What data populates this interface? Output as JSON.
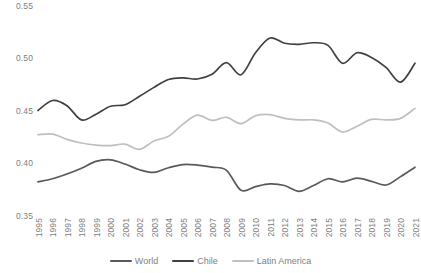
{
  "chart_data": {
    "type": "line",
    "title": "",
    "xlabel": "",
    "ylabel": "",
    "ylim": [
      0.35,
      0.55
    ],
    "yticks": [
      "0.35",
      "0.40",
      "0.45",
      "0.50",
      "0.55"
    ],
    "grid": false,
    "legend_position": "bottom",
    "categories": [
      "1995",
      "1996",
      "1997",
      "1998",
      "1999",
      "2000",
      "2001",
      "2002",
      "2003",
      "2004",
      "2005",
      "2006",
      "2007",
      "2008",
      "2009",
      "2010",
      "2011",
      "2012",
      "2013",
      "2014",
      "2015",
      "2016",
      "2017",
      "2018",
      "2019",
      "2020",
      "2021"
    ],
    "series": [
      {
        "name": "World",
        "color": "#595959",
        "values": [
          0.3825,
          0.3855,
          0.39,
          0.3955,
          0.402,
          0.4035,
          0.3995,
          0.394,
          0.3915,
          0.396,
          0.399,
          0.3985,
          0.3965,
          0.3935,
          0.3745,
          0.378,
          0.3805,
          0.379,
          0.3735,
          0.379,
          0.3855,
          0.3825,
          0.386,
          0.383,
          0.3795,
          0.3875,
          0.3965
        ]
      },
      {
        "name": "Chile",
        "color": "#404040",
        "values": [
          0.4505,
          0.46,
          0.455,
          0.4415,
          0.447,
          0.4545,
          0.456,
          0.464,
          0.4725,
          0.48,
          0.4815,
          0.4805,
          0.485,
          0.496,
          0.4845,
          0.5055,
          0.5195,
          0.5145,
          0.5135,
          0.515,
          0.5125,
          0.4955,
          0.5055,
          0.501,
          0.4915,
          0.4775,
          0.4955
        ]
      },
      {
        "name": "Latin America",
        "color": "#BFBFBF",
        "values": [
          0.4275,
          0.428,
          0.423,
          0.4195,
          0.4175,
          0.417,
          0.4185,
          0.4135,
          0.4215,
          0.426,
          0.4375,
          0.446,
          0.441,
          0.444,
          0.438,
          0.4455,
          0.4465,
          0.443,
          0.4415,
          0.4415,
          0.4385,
          0.43,
          0.4355,
          0.442,
          0.4415,
          0.443,
          0.4525
        ]
      }
    ]
  },
  "legend": {
    "items": [
      {
        "label": "World",
        "color": "#595959"
      },
      {
        "label": "Chile",
        "color": "#404040"
      },
      {
        "label": "Latin America",
        "color": "#BFBFBF"
      }
    ]
  },
  "axes": {
    "y_ticks": [
      "0.55",
      "0.50",
      "0.45",
      "0.40",
      "0.35"
    ],
    "x_ticks": [
      "1995",
      "1996",
      "1997",
      "1998",
      "1999",
      "2000",
      "2001",
      "2002",
      "2003",
      "2004",
      "2005",
      "2006",
      "2007",
      "2008",
      "2009",
      "2010",
      "2011",
      "2012",
      "2013",
      "2014",
      "2015",
      "2016",
      "2017",
      "2018",
      "2019",
      "2020",
      "2021"
    ]
  }
}
